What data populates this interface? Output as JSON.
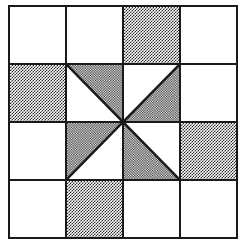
{
  "figure": {
    "kind": "quilt-block-diagram",
    "grid_rows": 4,
    "grid_cols": 4,
    "colors": {
      "light": "#ffffff",
      "dark": "#2b2b2b",
      "line": "#1a1a1a",
      "background": "#ffffff"
    },
    "cells": [
      {
        "id": "r1c1",
        "row": 1,
        "col": 1,
        "fill": "light",
        "shape": "solid",
        "name": "cell-r1c1-light"
      },
      {
        "id": "r1c2",
        "row": 1,
        "col": 2,
        "fill": "light",
        "shape": "solid",
        "name": "cell-r1c2-light"
      },
      {
        "id": "r1c3",
        "row": 1,
        "col": 3,
        "fill": "dark",
        "shape": "solid",
        "name": "cell-r1c3-dark"
      },
      {
        "id": "r1c4",
        "row": 1,
        "col": 4,
        "fill": "light",
        "shape": "solid",
        "name": "cell-r1c4-light"
      },
      {
        "id": "r2c1",
        "row": 2,
        "col": 1,
        "fill": "dark",
        "shape": "solid",
        "name": "cell-r2c1-dark"
      },
      {
        "id": "r2c2",
        "row": 2,
        "col": 2,
        "fill": "dark",
        "shape": "half-square-triangle",
        "dark_corner": "top-right",
        "diagonal": "tl-br",
        "name": "cell-r2c2-half-triangle"
      },
      {
        "id": "r2c3",
        "row": 2,
        "col": 3,
        "fill": "dark",
        "shape": "half-square-triangle",
        "dark_corner": "bottom-right",
        "diagonal": "bl-tr",
        "name": "cell-r2c3-half-triangle"
      },
      {
        "id": "r2c4",
        "row": 2,
        "col": 4,
        "fill": "light",
        "shape": "solid",
        "name": "cell-r2c4-light"
      },
      {
        "id": "r3c1",
        "row": 3,
        "col": 1,
        "fill": "light",
        "shape": "solid",
        "name": "cell-r3c1-light"
      },
      {
        "id": "r3c2",
        "row": 3,
        "col": 2,
        "fill": "dark",
        "shape": "half-square-triangle",
        "dark_corner": "top-left",
        "diagonal": "bl-tr",
        "name": "cell-r3c2-half-triangle"
      },
      {
        "id": "r3c3",
        "row": 3,
        "col": 3,
        "fill": "dark",
        "shape": "half-square-triangle",
        "dark_corner": "bottom-left",
        "diagonal": "tl-br",
        "name": "cell-r3c3-half-triangle"
      },
      {
        "id": "r3c4",
        "row": 3,
        "col": 4,
        "fill": "dark",
        "shape": "solid",
        "name": "cell-r3c4-dark"
      },
      {
        "id": "r4c1",
        "row": 4,
        "col": 1,
        "fill": "light",
        "shape": "solid",
        "name": "cell-r4c1-light"
      },
      {
        "id": "r4c2",
        "row": 4,
        "col": 2,
        "fill": "dark",
        "shape": "solid",
        "name": "cell-r4c2-dark"
      },
      {
        "id": "r4c3",
        "row": 4,
        "col": 3,
        "fill": "light",
        "shape": "solid",
        "name": "cell-r4c3-light"
      },
      {
        "id": "r4c4",
        "row": 4,
        "col": 4,
        "fill": "light",
        "shape": "solid",
        "name": "cell-r4c4-light"
      }
    ]
  }
}
